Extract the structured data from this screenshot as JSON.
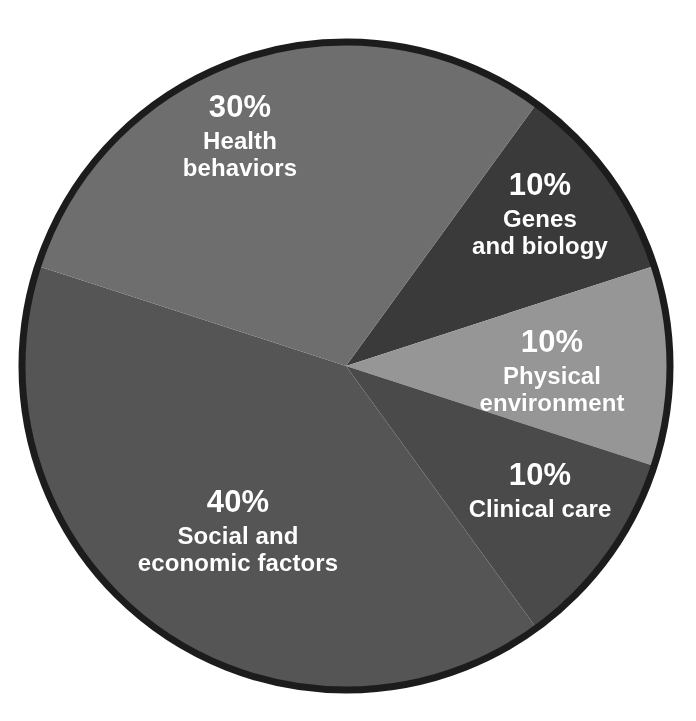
{
  "chart_data": {
    "type": "pie",
    "title": "",
    "subtitle": "",
    "legend_position": "inside-slices",
    "grid": false,
    "total": 100,
    "units": "percent",
    "center": {
      "x": 346,
      "y": 366
    },
    "radius": 324,
    "start_angle_deg": 36,
    "direction": "clockwise",
    "outline_color": "#1c1c1c",
    "label_color": "#ffffff",
    "background_color": "#ffffff",
    "categories": [
      "Genes and biology",
      "Physical environment",
      "Clinical care",
      "Social and economic factors",
      "Health behaviors"
    ],
    "values": [
      10,
      10,
      10,
      40,
      30
    ],
    "slices": [
      {
        "key": "genes_and_biology",
        "label": "Genes\nand biology",
        "percent_text": "10%",
        "value": 10,
        "color": "#3a3a3a",
        "start_deg": 36,
        "end_deg": 72
      },
      {
        "key": "physical_environment",
        "label": "Physical\nenvironment",
        "percent_text": "10%",
        "value": 10,
        "color": "#969696",
        "start_deg": 72,
        "end_deg": 108
      },
      {
        "key": "clinical_care",
        "label": "Clinical care",
        "percent_text": "10%",
        "value": 10,
        "color": "#4a4a4a",
        "start_deg": 108,
        "end_deg": 144
      },
      {
        "key": "social_and_economic_factors",
        "label": "Social and\neconomic factors",
        "percent_text": "40%",
        "value": 40,
        "color": "#555555",
        "start_deg": 144,
        "end_deg": 288
      },
      {
        "key": "health_behaviors",
        "label": "Health\nbehaviors",
        "percent_text": "30%",
        "value": 30,
        "color": "#6e6e6e",
        "start_deg": 288,
        "end_deg": 396
      }
    ],
    "xlabel": "",
    "ylabel": ""
  }
}
